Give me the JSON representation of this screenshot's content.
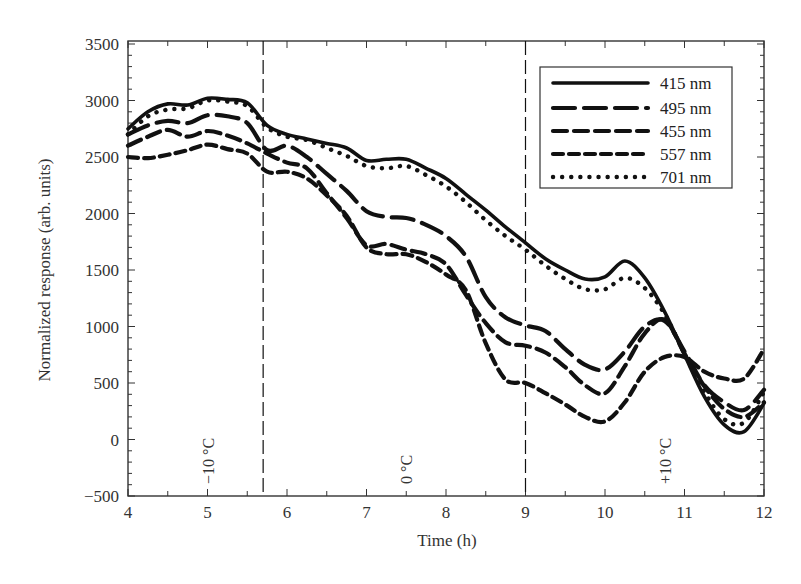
{
  "chart_data": {
    "type": "line",
    "title": "",
    "xlabel": "Time (h)",
    "ylabel": "Normalized response (arb. units)",
    "xlim": [
      4,
      12
    ],
    "ylim": [
      -500,
      3500
    ],
    "grid": false,
    "legend_position": "upper right (inside plot)",
    "x_ticks": [
      4,
      5,
      6,
      7,
      8,
      9,
      10,
      11,
      12
    ],
    "x_tick_labels": [
      "4",
      "5",
      "6",
      "7",
      "8",
      "9",
      "10",
      "11",
      "12"
    ],
    "y_ticks": [
      -500,
      0,
      500,
      1000,
      1500,
      2000,
      2500,
      3000,
      3500
    ],
    "y_tick_labels": [
      "−500",
      "0",
      "500",
      "1000",
      "1500",
      "2000",
      "2500",
      "3000",
      "3500"
    ],
    "x": [
      4.0,
      4.25,
      4.5,
      4.75,
      5.0,
      5.25,
      5.5,
      5.75,
      6.0,
      6.25,
      6.5,
      6.75,
      7.0,
      7.25,
      7.5,
      7.75,
      8.0,
      8.25,
      8.5,
      8.75,
      9.0,
      9.25,
      9.5,
      9.75,
      10.0,
      10.25,
      10.5,
      10.75,
      11.0,
      11.25,
      11.5,
      11.75,
      12.0
    ],
    "series": [
      {
        "name": "415 nm",
        "style": "solid",
        "values": [
          2750,
          2900,
          2970,
          2960,
          3020,
          3010,
          2980,
          2780,
          2700,
          2660,
          2620,
          2580,
          2470,
          2480,
          2480,
          2400,
          2310,
          2170,
          2030,
          1880,
          1740,
          1600,
          1500,
          1420,
          1440,
          1580,
          1430,
          1130,
          750,
          380,
          130,
          70,
          320
        ]
      },
      {
        "name": "495 nm",
        "style": "long-dash",
        "values": [
          2700,
          2780,
          2820,
          2800,
          2870,
          2860,
          2800,
          2560,
          2600,
          2500,
          2350,
          2200,
          2020,
          1970,
          1960,
          1900,
          1800,
          1620,
          1260,
          1080,
          1010,
          960,
          800,
          660,
          620,
          780,
          1000,
          1050,
          780,
          480,
          330,
          260,
          440
        ]
      },
      {
        "name": "455 nm",
        "style": "medium-dash",
        "values": [
          2600,
          2680,
          2740,
          2680,
          2730,
          2690,
          2620,
          2530,
          2450,
          2400,
          2180,
          1960,
          1720,
          1730,
          1680,
          1640,
          1550,
          1280,
          1030,
          860,
          830,
          770,
          640,
          480,
          410,
          650,
          940,
          1060,
          760,
          470,
          270,
          200,
          330
        ]
      },
      {
        "name": "557 nm",
        "style": "short-dash",
        "values": [
          2500,
          2490,
          2520,
          2560,
          2610,
          2570,
          2530,
          2370,
          2370,
          2310,
          2160,
          1980,
          1700,
          1640,
          1640,
          1570,
          1460,
          1320,
          850,
          530,
          500,
          410,
          310,
          200,
          160,
          330,
          600,
          730,
          730,
          600,
          540,
          540,
          800
        ]
      },
      {
        "name": "701 nm",
        "style": "dotted",
        "values": [
          2700,
          2860,
          2920,
          2930,
          3000,
          2990,
          2950,
          2760,
          2680,
          2650,
          2580,
          2510,
          2420,
          2400,
          2420,
          2340,
          2240,
          2100,
          1940,
          1800,
          1680,
          1540,
          1420,
          1330,
          1330,
          1430,
          1340,
          1110,
          760,
          420,
          180,
          150,
          420
        ]
      }
    ],
    "vertical_lines": [
      {
        "x": 5.7,
        "style": "long-dash"
      },
      {
        "x": 9.0,
        "style": "long-dash"
      }
    ],
    "annotations": [
      {
        "text": "−10 °C",
        "x": 5.0,
        "rotation": -90
      },
      {
        "text": "0 °C",
        "x": 7.5,
        "rotation": -90
      },
      {
        "text": "+10 °C",
        "x": 10.75,
        "rotation": -90
      }
    ]
  },
  "colors": {
    "line": "#111111",
    "axis": "#333333",
    "background": "#ffffff"
  }
}
